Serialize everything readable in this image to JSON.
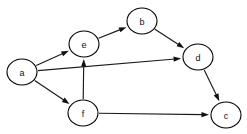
{
  "figure": {
    "kind": "directed-graph",
    "width": 247,
    "height": 134,
    "background_color": "#ffffff",
    "node_fill_color": "#ffffff",
    "node_stroke_color": "#000000",
    "edge_color": "#1a1a1a",
    "label_color": "#111111"
  },
  "nodes": [
    {
      "id": "a",
      "label": "a",
      "cx": 22,
      "cy": 72,
      "rx": 15,
      "ry": 13
    },
    {
      "id": "e",
      "label": "e",
      "cx": 84,
      "cy": 44,
      "rx": 15,
      "ry": 13
    },
    {
      "id": "b",
      "label": "b",
      "cx": 142,
      "cy": 21,
      "rx": 15,
      "ry": 13
    },
    {
      "id": "d",
      "label": "d",
      "cx": 198,
      "cy": 57,
      "rx": 15,
      "ry": 13
    },
    {
      "id": "c",
      "label": "c",
      "cx": 226,
      "cy": 115,
      "rx": 15,
      "ry": 13
    },
    {
      "id": "f",
      "label": "f",
      "cx": 83,
      "cy": 113,
      "rx": 15,
      "ry": 13
    }
  ],
  "edges": [
    {
      "id": "a-e",
      "from": "a",
      "to": "e",
      "directed": true
    },
    {
      "id": "a-d",
      "from": "a",
      "to": "d",
      "directed": true
    },
    {
      "id": "a-f",
      "from": "a",
      "to": "f",
      "directed": true
    },
    {
      "id": "e-b",
      "from": "e",
      "to": "b",
      "directed": true
    },
    {
      "id": "b-d",
      "from": "b",
      "to": "d",
      "directed": true
    },
    {
      "id": "d-c",
      "from": "d",
      "to": "c",
      "directed": true
    },
    {
      "id": "f-e",
      "from": "f",
      "to": "e",
      "directed": true
    },
    {
      "id": "f-c",
      "from": "f",
      "to": "c",
      "directed": true
    }
  ]
}
